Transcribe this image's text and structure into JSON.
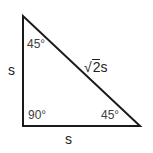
{
  "diagram": {
    "vertices": {
      "top": [
        23,
        16
      ],
      "right_angle": [
        23,
        126
      ],
      "bottom_right": [
        140,
        126
      ]
    },
    "stroke_color": "#1a1a1a",
    "labels": {
      "angle_top": "45°",
      "angle_right_angle": "90°",
      "angle_bottom_right": "45°",
      "side_vertical": "s",
      "side_horizontal": "s",
      "hypotenuse_radical": "√",
      "hypotenuse_radicand": "2",
      "hypotenuse_suffix": "s"
    }
  }
}
